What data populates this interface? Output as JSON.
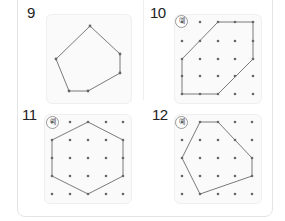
{
  "problems": [
    {
      "number": "9",
      "example_badge": null,
      "grid": false,
      "polygon": [
        [
          90,
          26
        ],
        [
          120,
          54
        ],
        [
          120,
          73
        ],
        [
          88,
          91
        ],
        [
          69,
          91
        ],
        [
          56,
          59
        ]
      ]
    },
    {
      "number": "10",
      "example_badge": "예",
      "grid": true,
      "grid_x": [
        182,
        200,
        218,
        235,
        253
      ],
      "grid_y": [
        22,
        41,
        59,
        76,
        94
      ],
      "polygon": [
        [
          218,
          22
        ],
        [
          253,
          22
        ],
        [
          253,
          59
        ],
        [
          218,
          94
        ],
        [
          182,
          94
        ],
        [
          182,
          59
        ]
      ]
    },
    {
      "number": "11",
      "example_badge": "예",
      "grid": true,
      "grid_x": [
        52,
        70,
        88,
        106,
        123
      ],
      "grid_y": [
        122,
        140,
        158,
        176,
        194
      ],
      "polygon": [
        [
          88,
          122
        ],
        [
          123,
          140
        ],
        [
          123,
          176
        ],
        [
          88,
          194
        ],
        [
          52,
          176
        ],
        [
          52,
          140
        ]
      ]
    },
    {
      "number": "12",
      "example_badge": "예",
      "grid": true,
      "grid_x": [
        182,
        200,
        218,
        235,
        252
      ],
      "grid_y": [
        122,
        140,
        158,
        176,
        194
      ],
      "polygon": [
        [
          200,
          122
        ],
        [
          218,
          122
        ],
        [
          252,
          158
        ],
        [
          252,
          176
        ],
        [
          200,
          194
        ],
        [
          182,
          158
        ]
      ]
    }
  ],
  "colors": {
    "line": "#6b6b6b",
    "dot": "#666666"
  }
}
